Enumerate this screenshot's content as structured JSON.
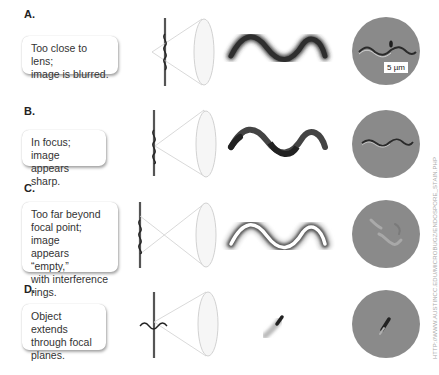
{
  "panels": [
    {
      "label": "A.",
      "caption": [
        "Too close to lens;",
        "image is blurred."
      ],
      "state": "blurred"
    },
    {
      "label": "B.",
      "caption": [
        "In focus; image",
        "appears sharp."
      ],
      "state": "sharp"
    },
    {
      "label": "C.",
      "caption": [
        "Too far beyond",
        "focal point; image",
        "appears “empty,”",
        "with interference",
        "rings."
      ],
      "state": "empty-rings"
    },
    {
      "label": "D.",
      "caption": [
        "Object extends",
        "through focal",
        "planes."
      ],
      "state": "extends"
    }
  ],
  "scale_bar": "5 µm",
  "credit": "HTTP://WWW.AUSTINCC.EDU/MICROBUGZ/ENDOSPORE_STAIN.PHP",
  "colors": {
    "micrograph_bg": "#8a8a8a",
    "object_dark": "#2e2e2e",
    "lens_stroke": "#cfcfcf",
    "slide_line": "#555555"
  }
}
